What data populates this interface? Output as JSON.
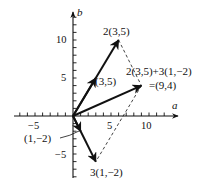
{
  "diagram": {
    "axes": {
      "x_label": "a",
      "y_label": "b",
      "x_ticks": [
        {
          "value": -5,
          "label": "−5"
        },
        {
          "value": 5,
          "label": "5"
        },
        {
          "value": 10,
          "label": "10"
        }
      ],
      "y_ticks": [
        {
          "value": 10,
          "label": "10"
        },
        {
          "value": 5,
          "label": "5"
        },
        {
          "value": -5,
          "label": "−5"
        }
      ],
      "x_range": [
        -7,
        12
      ],
      "y_range": [
        -8,
        13
      ]
    },
    "vectors": [
      {
        "name": "v",
        "from": [
          0,
          0
        ],
        "to": [
          3,
          5
        ],
        "label": "(3,5)",
        "style": "solid-arrow"
      },
      {
        "name": "2v",
        "from": [
          0,
          0
        ],
        "to": [
          6,
          10
        ],
        "label": "2(3,5)",
        "style": "solid-arrow"
      },
      {
        "name": "w",
        "from": [
          0,
          0
        ],
        "to": [
          1,
          -2
        ],
        "label": "(1,−2)",
        "style": "solid-arrow"
      },
      {
        "name": "3w",
        "from": [
          0,
          0
        ],
        "to": [
          3,
          -6
        ],
        "label": "3(1,−2)",
        "style": "solid-arrow"
      },
      {
        "name": "sum",
        "from": [
          0,
          0
        ],
        "to": [
          9,
          4
        ],
        "label": "2(3,5)+3(1,−2)",
        "label2": "=(9,4)",
        "style": "solid-arrow"
      }
    ],
    "dashed_lines": [
      {
        "from": [
          6,
          10
        ],
        "to": [
          9,
          4
        ]
      },
      {
        "from": [
          9,
          4
        ],
        "to": [
          3,
          -6
        ]
      }
    ],
    "colors": {
      "ink": "#111111",
      "background": "#ffffff"
    }
  }
}
